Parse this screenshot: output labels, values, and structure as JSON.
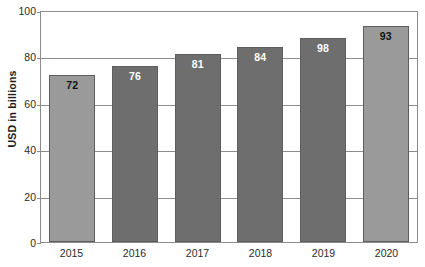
{
  "chart_data": {
    "type": "bar",
    "title": "",
    "xlabel": "",
    "ylabel": "USD in billions",
    "categories": [
      "2015",
      "2016",
      "2017",
      "2018",
      "2019",
      "2020"
    ],
    "values": [
      72,
      76,
      81,
      84,
      98,
      93
    ],
    "bar_heights": [
      72,
      76,
      81,
      84,
      88,
      93
    ],
    "data_labels": [
      "72",
      "76",
      "81",
      "84",
      "98",
      "93"
    ],
    "ylim": [
      0,
      100
    ],
    "ytick_values": [
      0,
      20,
      40,
      60,
      80,
      100
    ],
    "ytick_labels": [
      "0",
      "20",
      "40",
      "60",
      "80",
      "100"
    ],
    "grid": true,
    "legend": null,
    "series": [
      {
        "name": "USD in billions",
        "values": [
          72,
          76,
          81,
          84,
          98,
          93
        ]
      }
    ],
    "bar_styles": [
      {
        "category": "2015",
        "fill": "#9a9a9a",
        "label_color": "#111111"
      },
      {
        "category": "2016",
        "fill": "#6e6e6e",
        "label_color": "#ffffff"
      },
      {
        "category": "2017",
        "fill": "#6e6e6e",
        "label_color": "#ffffff"
      },
      {
        "category": "2018",
        "fill": "#6e6e6e",
        "label_color": "#ffffff"
      },
      {
        "category": "2019",
        "fill": "#6e6e6e",
        "label_color": "#ffffff"
      },
      {
        "category": "2020",
        "fill": "#9a9a9a",
        "label_color": "#111111"
      }
    ],
    "colors": {
      "bar_light": "#9a9a9a",
      "bar_dark": "#6e6e6e",
      "bar_border": "#5e5e5e",
      "axis": "#8c8c8c",
      "text": "#2b2b2b",
      "background": "#ffffff"
    }
  },
  "axis": {
    "y_title": "USD in billions"
  },
  "title_remnant": ""
}
